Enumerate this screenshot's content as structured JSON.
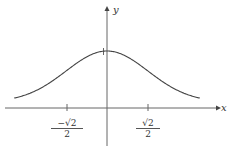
{
  "chart_data": {
    "type": "line",
    "title": "",
    "xlabel": "x",
    "ylabel": "y",
    "function": "y = e^(-x^2)",
    "x_ticks": [
      {
        "value": -0.7071,
        "label_num": "−√2",
        "label_den": "2"
      },
      {
        "value": 0.7071,
        "label_num": "√2",
        "label_den": "2"
      }
    ],
    "y_ticks": [
      {
        "value": 1,
        "label": ""
      }
    ],
    "x": [
      -1.8,
      -1.5,
      -1.2,
      -0.9,
      -0.7071,
      -0.5,
      -0.3,
      0,
      0.3,
      0.5,
      0.7071,
      0.9,
      1.2,
      1.5,
      1.8
    ],
    "values": [
      0.039,
      0.105,
      0.237,
      0.445,
      0.607,
      0.779,
      0.914,
      1.0,
      0.914,
      0.779,
      0.607,
      0.445,
      0.237,
      0.105,
      0.039
    ],
    "xlim": [
      -2,
      2
    ],
    "ylim": [
      0,
      1.3
    ],
    "grid": false,
    "legend": "none"
  },
  "axes": {
    "x_label": "x",
    "y_label": "y"
  },
  "colors": {
    "curve": "#444444",
    "axis": "#555555"
  }
}
